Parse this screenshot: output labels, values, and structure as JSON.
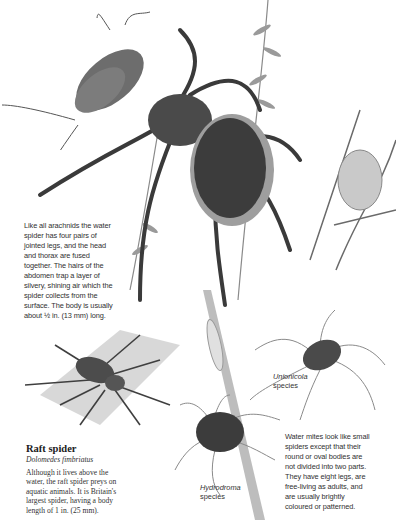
{
  "water_spider_text": {
    "lines": [
      "Like all arachnids the water",
      "spider has four pairs of",
      "jointed legs, and the head",
      "and thorax are fused",
      "together. The hairs of the",
      "abdomen trap a layer of",
      "silvery, shining air which the",
      "spider collects from the",
      "surface. The body is usually",
      "about ½ in. (13 mm) long."
    ]
  },
  "raft_spider": {
    "title": "Raft spider",
    "latin": "Dolomedes fimbriatus",
    "body_lines": [
      "Although it lives above the",
      "water, the raft spider preys on",
      "aquatic animals. It is Britain's",
      "largest spider, having a body",
      "length of 1 in. (25 mm)."
    ]
  },
  "unionicola": {
    "genus": "Unionicola",
    "label": "species"
  },
  "hydrodroma": {
    "genus": "Hydrodroma",
    "label": "species"
  },
  "water_mites_text": {
    "lines": [
      "Water mites look like small",
      "spiders except that their",
      "round or oval bodies are",
      "not divided into two parts.",
      "They have eight legs, are",
      "free-living as adults, and",
      "are usually brightly",
      "coloured or patterned."
    ]
  },
  "colors": {
    "ink": "#2a2a2a",
    "background": "#ffffff",
    "shade": "#5a5a5a"
  }
}
